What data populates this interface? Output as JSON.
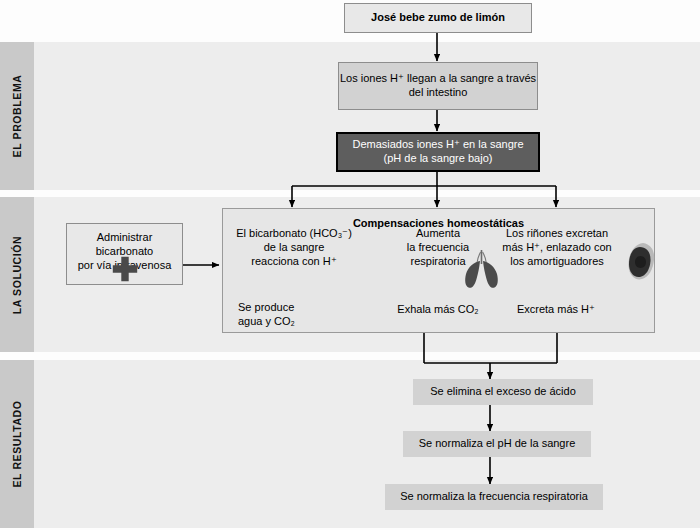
{
  "bands": [
    {
      "label": "EL PROBLEMA"
    },
    {
      "label": "LA SOLUCIÓN"
    },
    {
      "label": "EL RESULTADO"
    }
  ],
  "nodes": {
    "trigger": "José bebe zumo de limón",
    "absorption": "Los iones H⁺ llegan a la sangre a través del intestino",
    "acidosis_line1": "Demasiados iones H⁺ en la sangre",
    "acidosis_line2": "(pH de la sangre bajo)",
    "treatment_line1": "Administrar bicarbonato",
    "treatment_line2": "por vía intravenosa"
  },
  "panel": {
    "title": "Compensaciones homeostáticas",
    "columns": [
      {
        "top_line1": "El bicarbonato (HCO₃⁻)",
        "top_line2": "de la sangre",
        "top_line3": "reacciona con H⁺",
        "bottom_line1": "Se produce",
        "bottom_line2": "agua y CO₂"
      },
      {
        "top_line1": "Aumenta",
        "top_line2": "la frecuencia",
        "top_line3": "respiratoria",
        "bottom_line1": "Exhala más CO₂",
        "icon": "lungs-icon"
      },
      {
        "top_line1": "Los riñones excretan",
        "top_line2": "más H⁺, enlazado con",
        "top_line3": "los amortiguadores",
        "bottom_line1": "Excreta más H⁺",
        "icon": "kidney-icon"
      }
    ]
  },
  "results": [
    "Se elimina el exceso de ácido",
    "Se normaliza el pH de la sangre",
    "Se normaliza la frecuencia respiratoria"
  ],
  "colors": {
    "band_fill": "#ededed",
    "band_tab": "#c9c9c9",
    "box_light": "#d2d2d2",
    "box_dark": "#5e5e5e",
    "panel_fill": "#e6e6e6",
    "stroke": "#000000"
  }
}
